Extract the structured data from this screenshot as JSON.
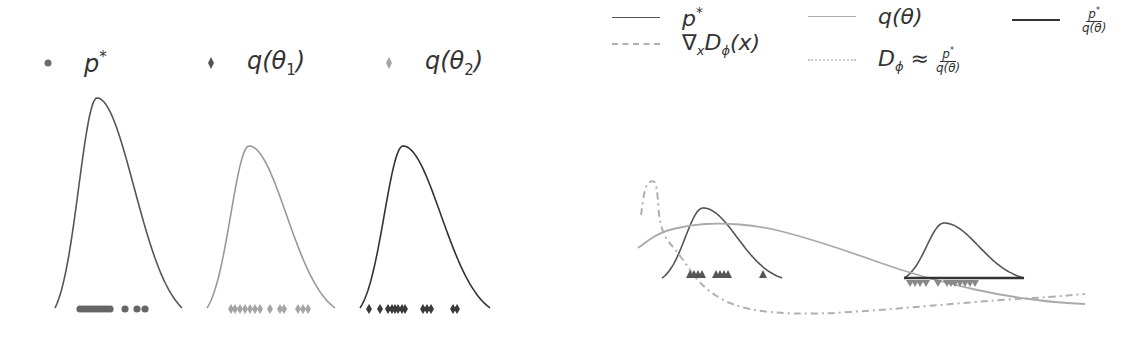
{
  "legend_left": [
    {
      "marker": "circle",
      "label": "p",
      "sup": "*",
      "sub": "",
      "color": "#6b6b6b",
      "x": 42
    },
    {
      "marker": "diamond",
      "label": "q(θ",
      "sub": "1",
      "tail": ")",
      "color": "#555555",
      "x": 205
    },
    {
      "marker": "diamond",
      "label": "q(θ",
      "sub": "2",
      "tail": ")",
      "color": "#a5a5a5",
      "x": 383
    }
  ],
  "legend_right": [
    {
      "style": "solid",
      "color": "#555555",
      "label_html": "p*",
      "label": "p",
      "sup": "*",
      "x": 12,
      "y": 4
    },
    {
      "style": "solid",
      "color": "#aaaaaa",
      "label": "q(θ)",
      "x": 208,
      "y": 4
    },
    {
      "style": "solid-thick",
      "color": "#333333",
      "label": "p* / q(θ)",
      "x": 412,
      "y": 4,
      "frac": {
        "num": "p*",
        "den": "q(θ)"
      }
    },
    {
      "style": "dashdot",
      "color": "#b0b0b0",
      "label": "∇ₓD_ϕ(x)",
      "x": 12,
      "y": 30
    },
    {
      "style": "dotted-light",
      "color": "#c8c8c8",
      "label": "D_ϕ ≈ p*/q(θ)",
      "x": 208,
      "y": 44,
      "frac": {
        "num": "p*",
        "den": "q(θ)"
      }
    }
  ],
  "chart_data": [
    {
      "type": "line",
      "title": "",
      "panel": "left-1",
      "series": [
        {
          "name": "p*",
          "color": "#555555",
          "shape": "peaked",
          "peak_x": 97,
          "peak_y": 98,
          "base_y": 308,
          "x_start": 55,
          "x_end": 182
        }
      ],
      "samples": {
        "marker": "circle",
        "color": "#666666",
        "x": [
          80,
          83,
          86,
          89,
          92,
          95,
          98,
          101,
          104,
          107,
          110,
          125,
          137,
          145
        ],
        "y": 309
      }
    },
    {
      "type": "line",
      "panel": "left-2",
      "series": [
        {
          "name": "q(θ2)",
          "color": "#999999",
          "peak_x": 249,
          "peak_y": 146,
          "base_y": 308,
          "x_start": 207,
          "x_end": 335
        }
      ],
      "samples": {
        "marker": "diamond",
        "color": "#a5a5a5",
        "x": [
          231,
          235,
          240,
          245,
          250,
          255,
          260,
          270,
          280,
          284,
          298,
          303,
          308
        ],
        "y": 309
      }
    },
    {
      "type": "line",
      "panel": "left-3",
      "series": [
        {
          "name": "q(θ1)",
          "color": "#333333",
          "peak_x": 403,
          "peak_y": 146,
          "base_y": 308,
          "x_start": 360,
          "x_end": 490
        }
      ],
      "samples": {
        "marker": "diamond",
        "color": "#3a3a3a",
        "x": [
          369,
          380,
          388,
          392,
          395,
          398,
          402,
          405,
          423,
          427,
          431,
          453,
          457
        ],
        "y": 309
      }
    },
    {
      "type": "line",
      "panel": "right",
      "series": [
        {
          "name": "p* (left bump)",
          "color": "#555555",
          "peak_x": 703,
          "peak_y": 208,
          "base_y": 278,
          "x_start": 662,
          "x_end": 782
        },
        {
          "name": "p*/q(θ) (right bump)",
          "color": "#555555",
          "peak_x": 944,
          "peak_y": 223,
          "base_y": 278,
          "x_start": 904,
          "x_end": 1024
        },
        {
          "name": "q(θ)",
          "color": "#aaaaaa",
          "points": [
            [
              638,
              248
            ],
            [
              660,
              232
            ],
            [
              690,
              225
            ],
            [
              720,
              223
            ],
            [
              760,
              226
            ],
            [
              800,
              236
            ],
            [
              850,
              252
            ],
            [
              900,
              270
            ],
            [
              950,
              284
            ],
            [
              1000,
              295
            ],
            [
              1050,
              302
            ],
            [
              1085,
              304
            ]
          ]
        },
        {
          "name": "∇xD_ϕ(x)",
          "color": "#b0b0b0",
          "style": "dashdot",
          "points": [
            [
              641,
              215
            ],
            [
              645,
              186
            ],
            [
              652,
              180
            ],
            [
              657,
              184
            ],
            [
              660,
              232
            ],
            [
              680,
              255
            ],
            [
              700,
              285
            ],
            [
              730,
              305
            ],
            [
              770,
              313
            ],
            [
              820,
              314
            ],
            [
              880,
              310
            ],
            [
              940,
              305
            ],
            [
              1000,
              300
            ],
            [
              1050,
              297
            ],
            [
              1085,
              294
            ]
          ]
        }
      ],
      "samples_up": {
        "marker": "triangle-up",
        "color": "#555555",
        "x": [
          690,
          694,
          698,
          702,
          716,
          720,
          724,
          728,
          763
        ],
        "y": 276
      },
      "samples_down": {
        "marker": "triangle-down",
        "color": "#888888",
        "x": [
          910,
          915,
          920,
          926,
          938,
          947,
          951,
          955,
          960,
          965,
          970,
          975
        ],
        "y": 283
      },
      "baseline_thick": {
        "x_start": 904,
        "x_end": 1024,
        "y": 278,
        "color": "#333333"
      }
    }
  ]
}
